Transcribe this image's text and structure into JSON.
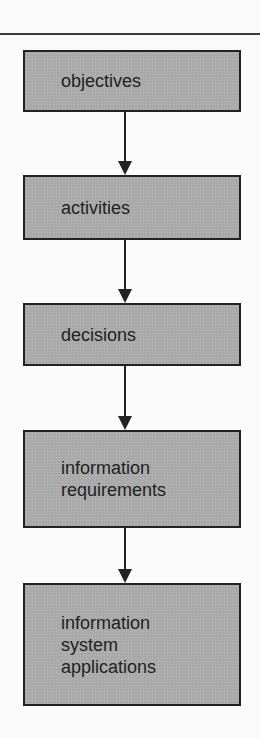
{
  "diagram": {
    "type": "flowchart",
    "direction": "top-to-bottom",
    "box_fill": "#a9a9a9",
    "box_border": "#222222",
    "nodes": [
      {
        "id": "objectives",
        "lines": [
          "objectives"
        ]
      },
      {
        "id": "activities",
        "lines": [
          "activities"
        ]
      },
      {
        "id": "decisions",
        "lines": [
          "decisions"
        ]
      },
      {
        "id": "information-requirements",
        "lines": [
          "information",
          "requirements"
        ]
      },
      {
        "id": "information-system-applications",
        "lines": [
          "information",
          "system",
          "applications"
        ]
      }
    ],
    "edges": [
      {
        "from": "objectives",
        "to": "activities"
      },
      {
        "from": "activities",
        "to": "decisions"
      },
      {
        "from": "decisions",
        "to": "information-requirements"
      },
      {
        "from": "information-requirements",
        "to": "information-system-applications"
      }
    ]
  }
}
